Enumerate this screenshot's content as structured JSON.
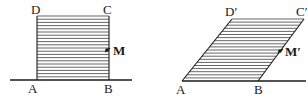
{
  "diagram": {
    "colors": {
      "line": "#1a1a1a",
      "hatch": "#555555",
      "background": "#ffffff"
    },
    "hatch_line_count": 21,
    "left_figure": {
      "name": "undeformed-block",
      "labels": {
        "A": "A",
        "B": "B",
        "C": "C",
        "D": "D",
        "M": "M"
      },
      "points": {
        "A": [
          37,
          80
        ],
        "B": [
          109,
          80
        ],
        "C": [
          109,
          16
        ],
        "D": [
          37,
          16
        ],
        "M": [
          107,
          50
        ]
      },
      "ground": {
        "x1": 10,
        "x2": 132,
        "y": 80
      }
    },
    "right_figure": {
      "name": "sheared-block",
      "labels": {
        "A": "A",
        "B": "B",
        "C": "C′",
        "D": "D′",
        "M": "M′"
      },
      "points": {
        "A": [
          182,
          81
        ],
        "B": [
          258,
          81
        ],
        "C": [
          304,
          19
        ],
        "D": [
          232,
          19
        ],
        "M": [
          280,
          51
        ]
      },
      "ground": {
        "x1": 182,
        "x2": 306,
        "y": 81
      }
    }
  }
}
